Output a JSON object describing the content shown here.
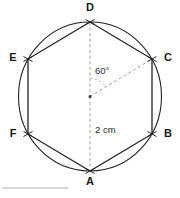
{
  "figure": {
    "shape_type": "hexagon-in-circle",
    "colors": {
      "stroke": "#222222",
      "dashed": "#9a9a9a",
      "text": "#1a1a1a",
      "rule": "#c9c9c9",
      "background": "#ffffff"
    },
    "circle": {
      "center_x": 90,
      "center_y": 96.5,
      "radius_x": 71.5,
      "radius_y": 74.5
    },
    "vertices": [
      {
        "id": "D",
        "label": "D",
        "x": 90,
        "y": 22
      },
      {
        "id": "C",
        "label": "C",
        "x": 152,
        "y": 59
      },
      {
        "id": "B",
        "label": "B",
        "x": 152,
        "y": 134
      },
      {
        "id": "A",
        "label": "A",
        "x": 90,
        "y": 171
      },
      {
        "id": "F",
        "label": "F",
        "x": 28,
        "y": 134
      },
      {
        "id": "E",
        "label": "E",
        "x": 28,
        "y": 59
      }
    ],
    "center_point": {
      "x": 90,
      "y": 96.5
    },
    "annotations": {
      "angle": {
        "value": "60°",
        "from_vertex": "D",
        "to_vertex": "C"
      },
      "radius": {
        "value": "2 cm",
        "from": "center",
        "to_vertex": "A"
      }
    },
    "dashed_segments": [
      {
        "name": "center-to-D",
        "x1": 90,
        "y1": 22,
        "x2": 90,
        "y2": 96.5
      },
      {
        "name": "center-to-A",
        "x1": 90,
        "y1": 96.5,
        "x2": 90,
        "y2": 171
      },
      {
        "name": "center-to-C",
        "x1": 90,
        "y1": 96.5,
        "x2": 152,
        "y2": 59
      }
    ],
    "footer_rule": {
      "x1": 2,
      "y1": 188,
      "x2": 68,
      "y2": 188
    }
  }
}
